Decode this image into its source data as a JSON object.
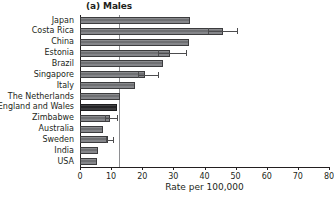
{
  "chart_data": {
    "type": "bar",
    "orientation": "horizontal",
    "title": "(a) Males",
    "xlabel": "Rate per 100,000",
    "ylabel": "",
    "xlim": [
      0,
      80
    ],
    "xticks": [
      0,
      10,
      20,
      30,
      40,
      50,
      60,
      70,
      80
    ],
    "xtick_labels": [
      "0",
      "10",
      "20",
      "30",
      "40",
      "50",
      "60",
      "70",
      "80"
    ],
    "grid": false,
    "legend": null,
    "reference_line": {
      "value": 12.5,
      "orientation": "vertical",
      "color": "#8e8f92"
    },
    "highlight_color": "#2f2f31",
    "bar_color": "#77787b",
    "highlighted_category": "England and Wales",
    "categories": [
      "Japan",
      "Costa Rica",
      "China",
      "Estonia",
      "Brazil",
      "Singapore",
      "Italy",
      "The Netherlands",
      "England and Wales",
      "Zimbabwe",
      "Australia",
      "Sweden",
      "India",
      "USA"
    ],
    "values": [
      35.3,
      45.8,
      35.1,
      28.9,
      26.8,
      20.9,
      17.7,
      12.9,
      11.9,
      9.7,
      7.4,
      9.0,
      5.8,
      5.5
    ],
    "error_low": [
      null,
      41.0,
      null,
      25.0,
      null,
      18.7,
      null,
      null,
      null,
      8.1,
      null,
      8.5,
      null,
      null
    ],
    "error_high": [
      null,
      50.6,
      null,
      33.9,
      null,
      24.9,
      null,
      null,
      null,
      11.9,
      null,
      10.5,
      null,
      null
    ]
  }
}
